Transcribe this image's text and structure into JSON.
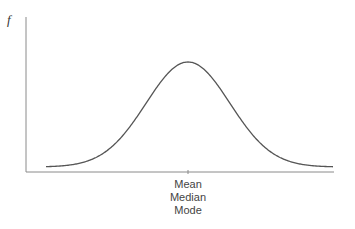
{
  "chart_data": {
    "type": "line",
    "title": "",
    "xlabel": "",
    "ylabel": "f",
    "x_tick_labels": [
      "Mean",
      "Median",
      "Mode"
    ],
    "x_tick_position": "center",
    "grid": false,
    "series": [
      {
        "name": "normal distribution",
        "shape": "bell",
        "symmetric": true,
        "peak_at": "Mean = Median = Mode"
      }
    ]
  },
  "axis": {
    "y_label": "f",
    "x_labels": [
      "Mean",
      "Median",
      "Mode"
    ]
  },
  "colors": {
    "curve": "#555555",
    "axis": "#888888",
    "text": "#444444"
  }
}
